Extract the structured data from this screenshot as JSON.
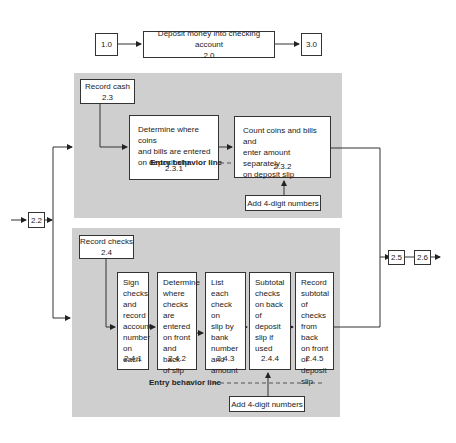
{
  "top_row": {
    "step_1_0": "1.0",
    "step_2_0_title": "Deposit money into checking account",
    "step_2_0_num": "2.0",
    "step_3_0": "3.0"
  },
  "branch": {
    "step_2_2": "2.2",
    "step_2_5": "2.5",
    "step_2_6": "2.6"
  },
  "cash_panel": {
    "header_title": "Record cash",
    "header_num": "2.3",
    "steps": [
      {
        "text": "Determine where coins\nand bills are entered\non deposit slip",
        "num": "2.3.1"
      },
      {
        "text": "Count coins and bills and\nenter amount separately\non deposit slip",
        "num": "2.3.2"
      }
    ],
    "entry_behavior_label": "Entry behavior line",
    "prerequisite": "Add 4-digit numbers"
  },
  "checks_panel": {
    "header_title": "Record checks",
    "header_num": "2.4",
    "steps": [
      {
        "text": "Sign\nchecks\nand\nrecord\naccount\nnumber\non each",
        "num": "2.4.1"
      },
      {
        "text": "Determine\nwhere\nchecks are\nentered\non front\nand back\nof slip",
        "num": "2.4.2"
      },
      {
        "text": "List each\ncheck on\nslip by\nbank\nnumber\nand\namount",
        "num": "2.4.3"
      },
      {
        "text": "Subtotal\nchecks\non back\nof deposit\nslip if\nused",
        "num": "2.4.4"
      },
      {
        "text": "Record\nsubtotal\nof checks\nfrom back\non front\nof deposit\nslip",
        "num": "2.4.5"
      }
    ],
    "entry_behavior_label": "Entry behavior line",
    "prerequisite": "Add 4-digit numbers"
  },
  "colors": {
    "panel_bg": "#cfcfcf",
    "line": "#333333",
    "box_bg": "#ffffff"
  }
}
